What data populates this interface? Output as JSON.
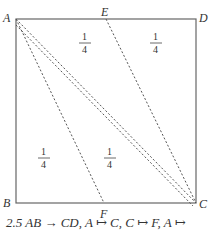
{
  "diagram": {
    "points": {
      "A": {
        "label": "A",
        "x": 16,
        "y": 19
      },
      "D": {
        "label": "D",
        "x": 196,
        "y": 19
      },
      "B": {
        "label": "B",
        "x": 16,
        "y": 203
      },
      "C": {
        "label": "C",
        "x": 196,
        "y": 203
      },
      "E": {
        "label": "E",
        "x": 106,
        "y": 19
      },
      "F": {
        "label": "F",
        "x": 104,
        "y": 203
      }
    },
    "fractions": [
      {
        "num": "1",
        "den": "4",
        "x": 85,
        "y": 45
      },
      {
        "num": "1",
        "den": "4",
        "x": 156,
        "y": 45
      },
      {
        "num": "1",
        "den": "4",
        "x": 45,
        "y": 160
      },
      {
        "num": "1",
        "den": "4",
        "x": 110,
        "y": 160
      }
    ],
    "dashed_lines": [
      "A-C",
      "A-F",
      "E-C",
      "A-C (second)"
    ],
    "line_color": "#555555"
  },
  "caption": "2.5   AB → CD,  A ↦ C,  C ↦ F,  A ↦"
}
